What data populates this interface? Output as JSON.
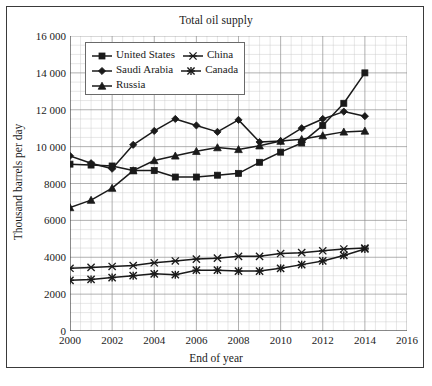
{
  "figure": {
    "title": "Total oil supply",
    "xlabel": "End of year",
    "ylabel": "Thousand barrels per day"
  },
  "legend": {
    "rows": [
      [
        {
          "label": "United States",
          "marker": "square"
        },
        {
          "label": "China",
          "marker": "asterisk"
        }
      ],
      [
        {
          "label": "Saudi Arabia",
          "marker": "diamond"
        },
        {
          "label": "Canada",
          "marker": "star"
        }
      ],
      [
        {
          "label": "Russia",
          "marker": "triangle"
        }
      ]
    ]
  },
  "axes": {
    "x_ticks": [
      "2000",
      "2002",
      "2004",
      "2006",
      "2008",
      "2010",
      "2012",
      "2014",
      "2016"
    ],
    "x_tick_values": [
      2000,
      2002,
      2004,
      2006,
      2008,
      2010,
      2012,
      2014,
      2016
    ],
    "y_ticks": [
      "0",
      "2000",
      "4000",
      "6000",
      "8000",
      "10 000",
      "12 000",
      "14 000",
      "16 000"
    ],
    "y_tick_values": [
      0,
      2000,
      4000,
      6000,
      8000,
      10000,
      12000,
      14000,
      16000
    ],
    "xlim": [
      2000,
      2016
    ],
    "ylim": [
      0,
      16000
    ],
    "grid": "minor-and-major"
  },
  "chart_data": {
    "type": "line",
    "title": "Total oil supply",
    "xlabel": "End of year",
    "ylabel": "Thousand barrels per day",
    "xlim": [
      2000,
      2016
    ],
    "ylim": [
      0,
      16000
    ],
    "grid": true,
    "legend_position": "top-left-inside",
    "x": [
      2000,
      2001,
      2002,
      2003,
      2004,
      2005,
      2006,
      2007,
      2008,
      2009,
      2010,
      2011,
      2012,
      2013,
      2014
    ],
    "series": [
      {
        "name": "United States",
        "marker": "square",
        "color": "#1a1a1a",
        "values": [
          9050,
          9000,
          8950,
          8700,
          8700,
          8350,
          8350,
          8450,
          8550,
          9150,
          9700,
          10200,
          11150,
          12350,
          14000
        ]
      },
      {
        "name": "Saudi Arabia",
        "marker": "diamond",
        "color": "#1a1a1a",
        "values": [
          9500,
          9100,
          8800,
          10100,
          10850,
          11500,
          11150,
          10800,
          11450,
          10250,
          10300,
          11000,
          11500,
          11900,
          11650
        ]
      },
      {
        "name": "Russia",
        "marker": "triangle",
        "color": "#1a1a1a",
        "values": [
          6700,
          7100,
          7750,
          8700,
          9250,
          9500,
          9750,
          9950,
          9850,
          10050,
          10300,
          10400,
          10600,
          10800,
          10850
        ]
      },
      {
        "name": "China",
        "marker": "asterisk",
        "color": "#1a1a1a",
        "values": [
          3400,
          3450,
          3500,
          3550,
          3700,
          3800,
          3900,
          3950,
          4050,
          4050,
          4200,
          4250,
          4350,
          4450,
          4500
        ]
      },
      {
        "name": "Canada",
        "marker": "star",
        "color": "#1a1a1a",
        "values": [
          2750,
          2800,
          2900,
          3000,
          3100,
          3050,
          3300,
          3300,
          3250,
          3250,
          3400,
          3600,
          3800,
          4100,
          4450
        ]
      }
    ]
  }
}
